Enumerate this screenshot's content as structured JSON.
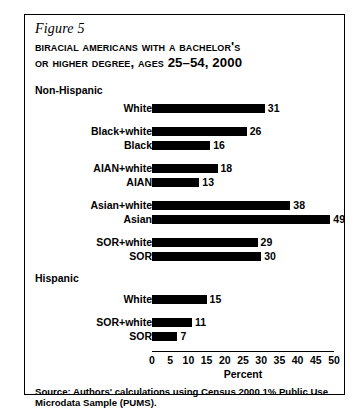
{
  "figure": {
    "number_label": "Figure 5",
    "title_line1": "Biracial Americans With a Bachelor's",
    "title_line2": "or Higher Degree, Ages 25–54, 2000",
    "source_note": "Source: Authors' calculations using Census 2000 1% Public Use Microdata Sample (PUMS)."
  },
  "groups": [
    {
      "label": "Non-Hispanic"
    },
    {
      "label": "Hispanic"
    }
  ],
  "chart_data": {
    "type": "bar",
    "orientation": "horizontal",
    "title": "Biracial Americans With a Bachelor's or Higher Degree, Ages 25–54, 2000",
    "xlabel": "Percent",
    "ylabel": "",
    "xlim": [
      0,
      50
    ],
    "xticks": [
      0,
      5,
      10,
      15,
      20,
      25,
      30,
      35,
      40,
      45,
      50
    ],
    "xtick_labels": [
      "0",
      "5",
      "10",
      "15",
      "20",
      "25",
      "30",
      "35",
      "40",
      "45",
      "50"
    ],
    "grid": false,
    "legend": null,
    "bar_color": "#000000",
    "group_labels": [
      "Non-Hispanic",
      "Hispanic"
    ],
    "categories": [
      "White",
      "Black+white",
      "Black",
      "AIAN+white",
      "AIAN",
      "Asian+white",
      "Asian",
      "SOR+white",
      "SOR",
      "White",
      "SOR+white",
      "SOR"
    ],
    "values": [
      31,
      26,
      16,
      18,
      13,
      38,
      49,
      29,
      30,
      15,
      11,
      7
    ],
    "bars": [
      {
        "group": "Non-Hispanic",
        "label": "White",
        "value": 31,
        "value_text": "31"
      },
      {
        "group": "Non-Hispanic",
        "label": "Black+white",
        "value": 26,
        "value_text": "26"
      },
      {
        "group": "Non-Hispanic",
        "label": "Black",
        "value": 16,
        "value_text": "16"
      },
      {
        "group": "Non-Hispanic",
        "label": "AIAN+white",
        "value": 18,
        "value_text": "18"
      },
      {
        "group": "Non-Hispanic",
        "label": "AIAN",
        "value": 13,
        "value_text": "13"
      },
      {
        "group": "Non-Hispanic",
        "label": "Asian+white",
        "value": 38,
        "value_text": "38"
      },
      {
        "group": "Non-Hispanic",
        "label": "Asian",
        "value": 49,
        "value_text": "49"
      },
      {
        "group": "Non-Hispanic",
        "label": "SOR+white",
        "value": 29,
        "value_text": "29"
      },
      {
        "group": "Non-Hispanic",
        "label": "SOR",
        "value": 30,
        "value_text": "30"
      },
      {
        "group": "Hispanic",
        "label": "White",
        "value": 15,
        "value_text": "15"
      },
      {
        "group": "Hispanic",
        "label": "SOR+white",
        "value": 11,
        "value_text": "11"
      },
      {
        "group": "Hispanic",
        "label": "SOR",
        "value": 7,
        "value_text": "7"
      }
    ]
  },
  "layout": {
    "bar_tops": [
      88,
      111,
      125,
      148,
      162,
      185,
      199,
      222,
      236,
      279,
      302,
      316
    ]
  }
}
